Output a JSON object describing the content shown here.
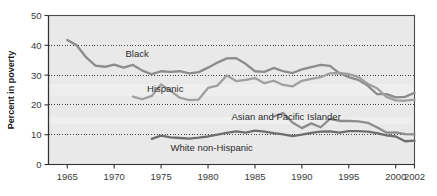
{
  "chart_data": {
    "type": "line",
    "title": "",
    "subtitle": "",
    "xlabel": "",
    "ylabel": "Percent in poverty",
    "xlim": [
      1963,
      2002
    ],
    "ylim": [
      0,
      50
    ],
    "grid": "horizontal-dotted",
    "legend_position": "inline-annotations",
    "xticks": [
      "1965",
      "1970",
      "1975",
      "1980",
      "1985",
      "1990",
      "1995",
      "2000",
      "2002"
    ],
    "xtick_values": [
      1965,
      1970,
      1975,
      1980,
      1985,
      1990,
      1995,
      2000,
      2002
    ],
    "yticks": [
      "0",
      "10",
      "20",
      "30",
      "40",
      "50"
    ],
    "ytick_values": [
      0,
      10,
      20,
      30,
      40,
      50
    ],
    "series": [
      {
        "name": "Black",
        "color": "#8c8c8c",
        "label_x": 1971.2,
        "label_y": 37.2,
        "x": [
          1965,
          1966,
          1967,
          1968,
          1969,
          1970,
          1971,
          1972,
          1973,
          1974,
          1975,
          1976,
          1977,
          1978,
          1979,
          1980,
          1981,
          1982,
          1983,
          1984,
          1985,
          1986,
          1987,
          1988,
          1989,
          1990,
          1991,
          1992,
          1993,
          1994,
          1995,
          1996,
          1997,
          1998,
          1999,
          2000,
          2001,
          2002
        ],
        "values": [
          41.8,
          40.0,
          36.0,
          33.2,
          32.8,
          33.5,
          32.5,
          33.4,
          31.5,
          30.3,
          31.3,
          31.1,
          31.3,
          30.6,
          31.0,
          32.5,
          34.2,
          35.6,
          35.7,
          33.8,
          31.3,
          31.1,
          32.4,
          31.3,
          30.7,
          31.9,
          32.7,
          33.4,
          33.1,
          30.6,
          29.3,
          28.4,
          26.5,
          23.6,
          23.6,
          22.5,
          22.7,
          24.1
        ]
      },
      {
        "name": "Hispanic",
        "color": "#9f9f9f",
        "label_x": 1973.5,
        "label_y": 25.4,
        "x": [
          1972,
          1973,
          1974,
          1975,
          1976,
          1977,
          1978,
          1979,
          1980,
          1981,
          1982,
          1983,
          1984,
          1985,
          1986,
          1987,
          1988,
          1989,
          1990,
          1991,
          1992,
          1993,
          1994,
          1995,
          1996,
          1997,
          1998,
          1999,
          2000,
          2001,
          2002
        ],
        "values": [
          22.8,
          21.9,
          23.0,
          26.9,
          24.7,
          22.4,
          21.6,
          21.8,
          25.7,
          26.5,
          29.9,
          28.0,
          28.4,
          29.0,
          27.3,
          28.1,
          26.7,
          26.2,
          28.1,
          28.7,
          29.3,
          30.6,
          30.7,
          30.3,
          29.4,
          27.1,
          25.6,
          22.7,
          21.5,
          21.4,
          21.8
        ]
      },
      {
        "name": "Asian and Pacific Islander",
        "color": "#8c8c8c",
        "label_x": 1982.5,
        "label_y": 16.0,
        "x": [
          1987,
          1988,
          1989,
          1990,
          1991,
          1992,
          1993,
          1994,
          1995,
          1996,
          1997,
          1998,
          1999,
          2000,
          2001,
          2002
        ],
        "values": [
          16.1,
          17.3,
          14.1,
          12.2,
          13.8,
          12.5,
          15.3,
          14.6,
          14.6,
          14.5,
          14.0,
          12.5,
          10.7,
          10.8,
          10.2,
          10.1
        ]
      },
      {
        "name": "White non-Hispanic",
        "color": "#6e6e6e",
        "label_x": 1976.0,
        "label_y": 5.6,
        "x": [
          1974,
          1975,
          1976,
          1977,
          1978,
          1979,
          1980,
          1981,
          1982,
          1983,
          1984,
          1985,
          1986,
          1987,
          1988,
          1989,
          1990,
          1991,
          1992,
          1993,
          1994,
          1995,
          1996,
          1997,
          1998,
          1999,
          2000,
          2001,
          2002
        ],
        "values": [
          8.6,
          9.7,
          9.1,
          8.9,
          8.7,
          9.0,
          9.4,
          10.0,
          10.6,
          11.1,
          10.7,
          11.4,
          11.0,
          10.5,
          10.1,
          9.5,
          10.0,
          10.6,
          11.0,
          11.1,
          10.7,
          11.2,
          11.2,
          11.0,
          10.5,
          9.8,
          9.4,
          7.8,
          8.0
        ]
      }
    ],
    "axis_color": "#4a4a4a",
    "gridline_color": "#333333",
    "plot_background": "#e9e9e9"
  }
}
